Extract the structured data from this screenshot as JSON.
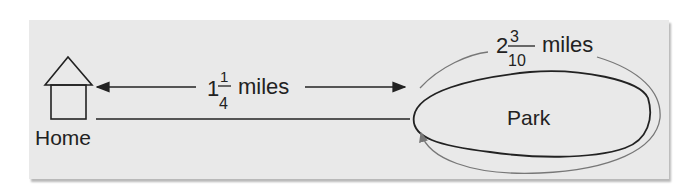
{
  "diagram": {
    "home_label": "Home",
    "park_label": "Park",
    "home_to_park": {
      "whole": "1",
      "numerator": "1",
      "denominator": "4",
      "unit": "miles"
    },
    "park_loop": {
      "whole": "2",
      "numerator": "3",
      "denominator": "10",
      "unit": "miles"
    },
    "colors": {
      "panel": "#e9e9e9",
      "ink": "#222222",
      "loop_arrow": "#777777"
    }
  }
}
